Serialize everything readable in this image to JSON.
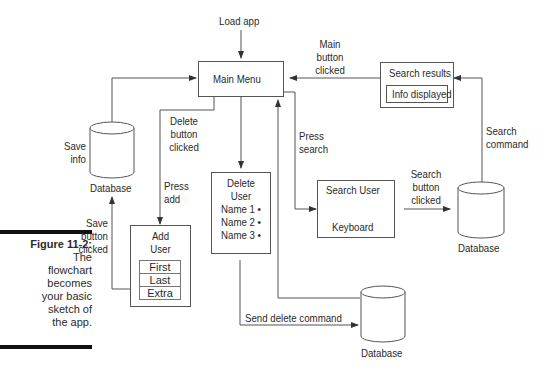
{
  "caption": {
    "figure_label": "Figure 11-2:",
    "text_lines": [
      "The",
      "flowchart",
      "becomes",
      "your basic",
      "sketch of",
      "the app."
    ]
  },
  "nodes": {
    "load_app": "Load app",
    "main_menu": "Main Menu",
    "search_results": {
      "title": "Search results",
      "inner": "Info displayed"
    },
    "database_save": "Database",
    "delete_user": {
      "title_line1": "Delete",
      "title_line2": "User",
      "items": [
        "Name 1 •",
        "Name 2 •",
        "Name 3 •"
      ]
    },
    "add_user": {
      "title_line1": "Add",
      "title_line2": "User",
      "fields": [
        "First",
        "Last",
        "Extra"
      ]
    },
    "search_user": {
      "title": "Search User",
      "footer": "Keyboard"
    },
    "database_search": "Database",
    "database_delete": "Database"
  },
  "edges": {
    "main_button_clicked": [
      "Main",
      "button",
      "clicked"
    ],
    "save_info": [
      "Save",
      "info"
    ],
    "delete_button_clicked": [
      "Delete",
      "button",
      "clicked"
    ],
    "press_add": [
      "Press",
      "add"
    ],
    "press_search": [
      "Press",
      "search"
    ],
    "search_command": [
      "Search",
      "command"
    ],
    "search_button_clicked": [
      "Search",
      "button",
      "clicked"
    ],
    "save_button_clicked": [
      "Save",
      "button",
      "clicked"
    ],
    "send_delete_command": "Send delete command"
  }
}
